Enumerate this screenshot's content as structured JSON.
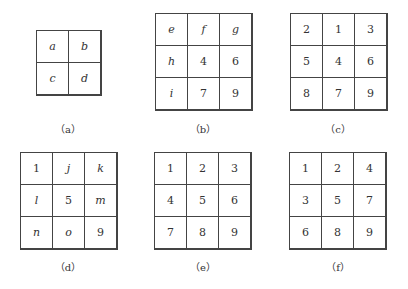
{
  "panels": [
    {
      "id": "a",
      "caption": "（a）",
      "rows": [
        [
          "a",
          "b"
        ],
        [
          "c",
          "d"
        ]
      ]
    },
    {
      "id": "b",
      "caption": "（b）",
      "rows": [
        [
          "e",
          "f",
          "g"
        ],
        [
          "h",
          "4",
          "6"
        ],
        [
          "i",
          "7",
          "9"
        ]
      ]
    },
    {
      "id": "c",
      "caption": "（c）",
      "rows": [
        [
          "2",
          "1",
          "3"
        ],
        [
          "5",
          "4",
          "6"
        ],
        [
          "8",
          "7",
          "9"
        ]
      ]
    },
    {
      "id": "d",
      "caption": "（d）",
      "rows": [
        [
          "1",
          "j",
          "k"
        ],
        [
          "l",
          "5",
          "m"
        ],
        [
          "n",
          "o",
          "9"
        ]
      ]
    },
    {
      "id": "e",
      "caption": "（e）",
      "rows": [
        [
          "1",
          "2",
          "3"
        ],
        [
          "4",
          "5",
          "6"
        ],
        [
          "7",
          "8",
          "9"
        ]
      ]
    },
    {
      "id": "f",
      "caption": "（f）",
      "rows": [
        [
          "1",
          "2",
          "4"
        ],
        [
          "3",
          "5",
          "7"
        ],
        [
          "6",
          "8",
          "9"
        ]
      ]
    }
  ]
}
